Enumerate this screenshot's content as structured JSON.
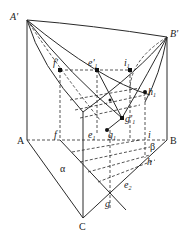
{
  "diagram": {
    "title": "",
    "labels": {
      "A_prime": "A'",
      "B_prime": "B'",
      "f_prime": "f'",
      "e1_prime": "e'",
      "e1_prime_sub": "1",
      "i1": "i",
      "i1_sub": "1",
      "h1": "h",
      "h1_sub": "1",
      "g1_prime": "g'",
      "g1_prime_sub": "1",
      "e1": "e",
      "e1_sub": "1",
      "g1": "g",
      "g1_sub": "1",
      "f": "f",
      "i": "i",
      "h": "h",
      "beta": "β",
      "alpha": "α",
      "A": "A",
      "B": "B",
      "C": "C",
      "g": "g",
      "e2": "e",
      "e2_sub": "2"
    },
    "colors": {
      "line": "#2a2a2a",
      "background": "#ffffff"
    }
  }
}
